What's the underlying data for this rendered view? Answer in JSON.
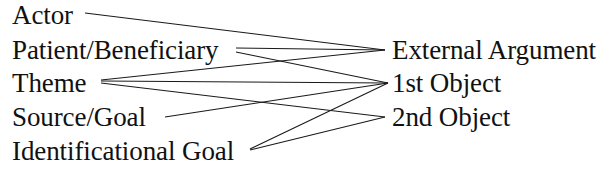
{
  "diagram": {
    "left_column": {
      "heading": "",
      "items": [
        {
          "id": "actor",
          "label": "Actor"
        },
        {
          "id": "patient-beneficiary",
          "label": "Patient/Beneficiary"
        },
        {
          "id": "theme",
          "label": "Theme"
        },
        {
          "id": "source-goal",
          "label": "Source/Goal"
        },
        {
          "id": "identificational-goal",
          "label": "Identificational Goal"
        }
      ]
    },
    "right_column": {
      "heading": "",
      "items": [
        {
          "id": "external-argument",
          "label": "External Argument"
        },
        {
          "id": "first-object",
          "label": "1st Object"
        },
        {
          "id": "second-object",
          "label": "2nd Object"
        }
      ]
    },
    "edges": [
      {
        "from": "actor",
        "to": "external-argument"
      },
      {
        "from": "patient-beneficiary",
        "to": "external-argument"
      },
      {
        "from": "patient-beneficiary",
        "to": "first-object"
      },
      {
        "from": "theme",
        "to": "external-argument"
      },
      {
        "from": "theme",
        "to": "first-object"
      },
      {
        "from": "theme",
        "to": "second-object"
      },
      {
        "from": "source-goal",
        "to": "first-object"
      },
      {
        "from": "identificational-goal",
        "to": "external-argument"
      },
      {
        "from": "identificational-goal",
        "to": "first-object"
      }
    ],
    "colors": {
      "background": "#ffffff",
      "text": "#111111",
      "edge": "#1a1a1a"
    }
  }
}
